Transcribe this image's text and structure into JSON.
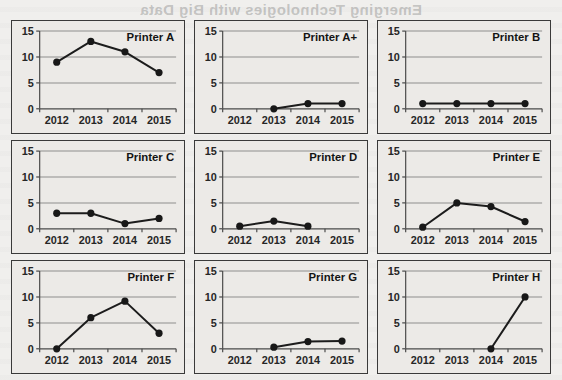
{
  "page": {
    "background_bleed_text": "Emerging Technologies with Big Data",
    "background_color": "#f2f1ef",
    "panel_fill": "#eceae7",
    "panel_border_color": "#3a3a3a",
    "line_color": "#1c1c1c",
    "marker_color": "#181818",
    "gridline_color": "#8d8d8d"
  },
  "chart_data": [
    {
      "type": "line",
      "title": "Printer A",
      "categories": [
        "2012",
        "2013",
        "2014",
        "2015"
      ],
      "values": [
        9,
        13,
        11,
        7
      ],
      "yticks": [
        0,
        5,
        10,
        15
      ],
      "ylim": [
        0,
        15
      ],
      "xlabel": "",
      "ylabel": "",
      "grid": true,
      "legend": "none"
    },
    {
      "type": "line",
      "title": "Printer A+",
      "categories": [
        "2012",
        "2013",
        "2014",
        "2015"
      ],
      "values": [
        null,
        0,
        1,
        1
      ],
      "yticks": [
        0,
        5,
        10,
        15
      ],
      "ylim": [
        0,
        15
      ],
      "xlabel": "",
      "ylabel": "",
      "grid": true,
      "legend": "none"
    },
    {
      "type": "line",
      "title": "Printer B",
      "categories": [
        "2012",
        "2013",
        "2014",
        "2015"
      ],
      "values": [
        1,
        1,
        1,
        1
      ],
      "yticks": [
        0,
        5,
        10,
        15
      ],
      "ylim": [
        0,
        15
      ],
      "xlabel": "",
      "ylabel": "",
      "grid": true,
      "legend": "none"
    },
    {
      "type": "line",
      "title": "Printer C",
      "categories": [
        "2012",
        "2013",
        "2014",
        "2015"
      ],
      "values": [
        3,
        3,
        1,
        2
      ],
      "yticks": [
        0,
        5,
        10,
        15
      ],
      "ylim": [
        0,
        15
      ],
      "xlabel": "",
      "ylabel": "",
      "grid": true,
      "legend": "none"
    },
    {
      "type": "line",
      "title": "Printer D",
      "categories": [
        "2012",
        "2013",
        "2014",
        "2015"
      ],
      "values": [
        0.5,
        1.5,
        0.5,
        null
      ],
      "yticks": [
        0,
        5,
        10,
        15
      ],
      "ylim": [
        0,
        15
      ],
      "xlabel": "",
      "ylabel": "",
      "grid": true,
      "legend": "none"
    },
    {
      "type": "line",
      "title": "Printer E",
      "categories": [
        "2012",
        "2013",
        "2014",
        "2015"
      ],
      "values": [
        0.3,
        5,
        4.3,
        1.4
      ],
      "yticks": [
        0,
        5,
        10,
        15
      ],
      "ylim": [
        0,
        15
      ],
      "xlabel": "",
      "ylabel": "",
      "grid": true,
      "legend": "none"
    },
    {
      "type": "line",
      "title": "Printer F",
      "categories": [
        "2012",
        "2013",
        "2014",
        "2015"
      ],
      "values": [
        0,
        6,
        9.2,
        3
      ],
      "yticks": [
        0,
        5,
        10,
        15
      ],
      "ylim": [
        0,
        15
      ],
      "xlabel": "",
      "ylabel": "",
      "grid": true,
      "legend": "none"
    },
    {
      "type": "line",
      "title": "Printer G",
      "categories": [
        "2012",
        "2013",
        "2014",
        "2015"
      ],
      "values": [
        null,
        0.3,
        1.4,
        1.5
      ],
      "yticks": [
        0,
        5,
        10,
        15
      ],
      "ylim": [
        0,
        15
      ],
      "xlabel": "",
      "ylabel": "",
      "grid": true,
      "legend": "none"
    },
    {
      "type": "line",
      "title": "Printer H",
      "categories": [
        "2012",
        "2013",
        "2014",
        "2015"
      ],
      "values": [
        null,
        null,
        0,
        10
      ],
      "yticks": [
        0,
        5,
        10,
        15
      ],
      "ylim": [
        0,
        15
      ],
      "xlabel": "",
      "ylabel": "",
      "grid": true,
      "legend": "none"
    }
  ]
}
